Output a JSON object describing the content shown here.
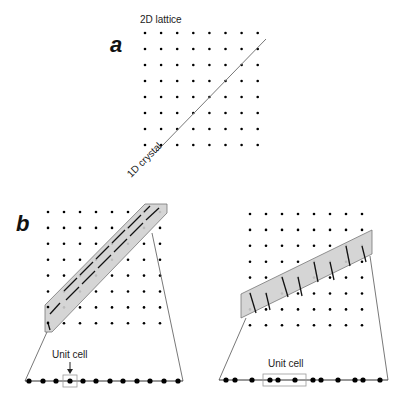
{
  "panel_a": {
    "label": "a",
    "title": "2D lattice",
    "line_label": "1D crystal",
    "grid": {
      "cols": 8,
      "rows": 8
    }
  },
  "panel_b": {
    "label": "b",
    "left": {
      "unit_cell_label": "Unit cell",
      "grid": {
        "cols": 8,
        "rows": 8
      },
      "chain_atoms": 12
    },
    "right": {
      "unit_cell_label": "Unit cell",
      "grid": {
        "cols": 8,
        "rows": 8
      },
      "chain_atoms": 12
    }
  },
  "colors": {
    "band_fill": "#d0d0d0",
    "band_stroke": "#777777",
    "dot": "#000000",
    "line": "#555555"
  }
}
